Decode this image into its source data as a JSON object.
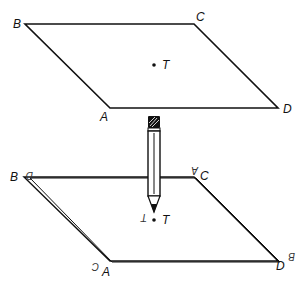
{
  "diagram": {
    "top_sheet": {
      "vertices": {
        "B": {
          "label": "B"
        },
        "C": {
          "label": "C"
        },
        "A": {
          "label": "A"
        },
        "D": {
          "label": "D"
        }
      },
      "point": {
        "label": "T"
      }
    },
    "bottom_sheet": {
      "vertices": {
        "B": {
          "label": "B"
        },
        "C": {
          "label": "C"
        },
        "A": {
          "label": "A"
        },
        "D": {
          "label": "D"
        }
      },
      "mirrored_labels": {
        "near_B": "D",
        "near_C": "A",
        "near_A": "C",
        "near_D": "B"
      },
      "point": {
        "label": "T",
        "mirrored_label": "T"
      }
    },
    "colors": {
      "stroke": "#111111",
      "background": "#ffffff"
    }
  }
}
